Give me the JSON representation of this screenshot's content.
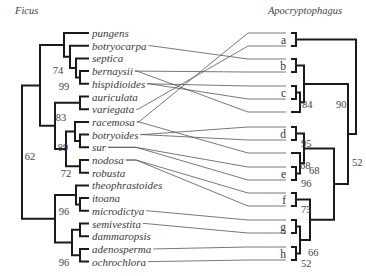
{
  "figure": {
    "left_title": "Ficus",
    "right_title": "Apocryptophagus",
    "left_taxa": [
      "pungens",
      "botryocarpa",
      "septica",
      "bernaysii",
      "hispidioides",
      "auriculata",
      "variegata",
      "racemosa",
      "botryoides",
      "sur",
      "nodosa",
      "robusta",
      "theophrastoides",
      "itoana",
      "microdictya",
      "semivestita",
      "dammaropsis",
      "adenosperma",
      "ochrochlora"
    ],
    "left_support": [
      {
        "label": "74",
        "node": "septica-bernaysii-hispidioides+botryocarpa"
      },
      {
        "label": "99",
        "node": "bernaysii-hispidioides"
      },
      {
        "label": "83",
        "node": "racemosa-botryoides-sur"
      },
      {
        "label": "89",
        "node": "botryoides-sur"
      },
      {
        "label": "72",
        "node": "nodosa-robusta"
      },
      {
        "label": "62",
        "node": "root"
      },
      {
        "label": "96",
        "node": "itoana-microdictya"
      },
      {
        "label": "96",
        "node": "adenosperma-ochrochlora"
      }
    ],
    "right_clades": [
      "a",
      "b",
      "c",
      "d",
      "e",
      "f",
      "g",
      "h"
    ],
    "right_support": [
      {
        "label": "84",
        "node": "c+single"
      },
      {
        "label": "90",
        "node": "b-c"
      },
      {
        "label": "52",
        "node": "root"
      },
      {
        "label": "95",
        "node": "d"
      },
      {
        "label": "68",
        "node": "single+e"
      },
      {
        "label": "96",
        "node": "e"
      },
      {
        "label": "68",
        "node": "d-e"
      },
      {
        "label": "75",
        "node": "f"
      },
      {
        "label": "66",
        "node": "g-h"
      },
      {
        "label": "52",
        "node": "h"
      }
    ],
    "associations": [
      [
        "botryocarpa",
        2
      ],
      [
        "bernaysii",
        3
      ],
      [
        "bernaysii",
        6
      ],
      [
        "hispidioides",
        4
      ],
      [
        "hispidioides",
        5
      ],
      [
        "variegata",
        1
      ],
      [
        "racemosa",
        0
      ],
      [
        "racemosa",
        9
      ],
      [
        "botryoides",
        7
      ],
      [
        "botryoides",
        8
      ],
      [
        "sur",
        10
      ],
      [
        "sur",
        11
      ],
      [
        "nodosa",
        12
      ],
      [
        "nodosa",
        13
      ],
      [
        "microdictya",
        14
      ],
      [
        "semivestita",
        15
      ],
      [
        "adenosperma",
        16
      ],
      [
        "ochrochlora",
        17
      ]
    ]
  }
}
